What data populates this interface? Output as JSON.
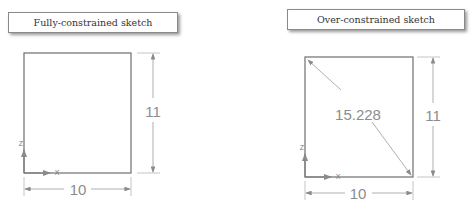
{
  "panels": [
    {
      "caption": "Fully-constrained sketch",
      "width_dimension": "10",
      "height_dimension": "11",
      "axis_labels": {
        "vertical": "Z",
        "horizontal": "X"
      }
    },
    {
      "caption": "Over-constrained sketch",
      "width_dimension": "10",
      "height_dimension": "11",
      "diagonal_dimension": "15.228",
      "axis_labels": {
        "vertical": "Z",
        "horizontal": "X"
      }
    }
  ],
  "colors": {
    "sketch_line": "#6e6e6e",
    "dimension": "#9a9a9a",
    "caption_border": "#8a8a8a"
  }
}
